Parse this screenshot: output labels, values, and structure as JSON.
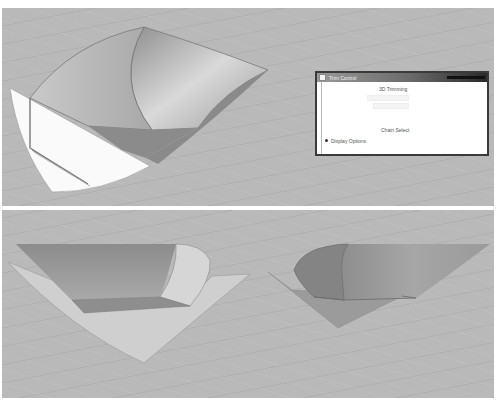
{
  "viewports": [
    {
      "id": "top",
      "description": "Perspective view of swept surface model with guide curves",
      "background_color": "#b9b9b9"
    },
    {
      "id": "bottom",
      "description": "Two perspective views of the same surface model",
      "background_color": "#b9b9b9"
    }
  ],
  "dialog": {
    "title": "Trim Control",
    "section_heading": "3D Trimming",
    "disabled_controls": [
      "",
      ""
    ],
    "section_label": "Chain Select",
    "radio_option": "Display Options"
  },
  "colors": {
    "surface_dark": "#8e8e8e",
    "surface_mid": "#a6a6a6",
    "surface_light": "#f4f4f4",
    "edge": "#6e6e6e",
    "dialog_border": "#3a3a3a"
  }
}
